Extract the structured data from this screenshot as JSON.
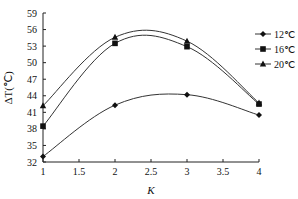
{
  "chart_data": {
    "type": "line",
    "title": "",
    "xlabel": "K",
    "ylabel": "ΔT(℃)",
    "x": [
      1,
      2,
      3,
      4
    ],
    "xlim": [
      1,
      4
    ],
    "ylim": [
      32,
      59
    ],
    "xticks": [
      "1",
      "1.5",
      "2",
      "2.5",
      "3",
      "3.5",
      "4"
    ],
    "yticks": [
      "32",
      "35",
      "38",
      "41",
      "44",
      "47",
      "50",
      "53",
      "56",
      "59"
    ],
    "grid": false,
    "legend_position": "upper right",
    "smooth": true,
    "series": [
      {
        "name": "12℃",
        "marker": "diamond",
        "values": [
          33.0,
          42.3,
          44.2,
          40.5
        ]
      },
      {
        "name": "16℃",
        "marker": "square",
        "values": [
          38.5,
          53.5,
          52.9,
          42.5
        ]
      },
      {
        "name": "20℃",
        "marker": "triangle",
        "values": [
          42.2,
          54.6,
          53.9,
          42.7
        ]
      }
    ]
  },
  "axes": {
    "x_title": "K",
    "y_title": "ΔT(℃)"
  },
  "legend": {
    "items": [
      {
        "label": "12℃",
        "marker": "diamond"
      },
      {
        "label": "16℃",
        "marker": "square"
      },
      {
        "label": "20℃",
        "marker": "triangle"
      }
    ]
  }
}
